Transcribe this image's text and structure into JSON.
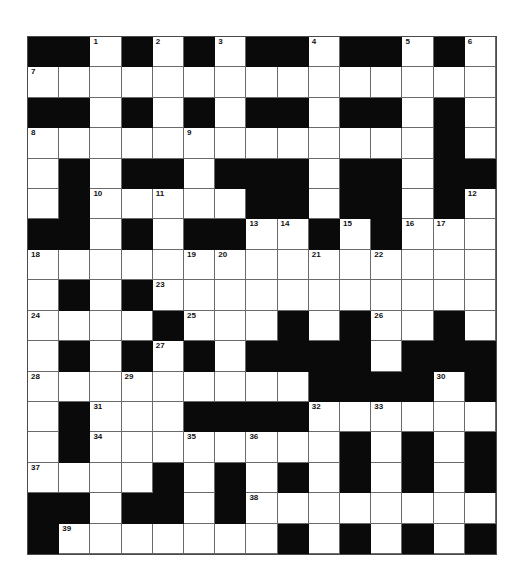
{
  "puzzle": {
    "rows": 17,
    "cols": 15,
    "colors": {
      "block": "#0a0a0a",
      "cell": "#ffffff",
      "grid_line": "#6a6a6a"
    },
    "grid": [
      [
        "#",
        "#",
        "1",
        "#",
        "2",
        "#",
        "3",
        "#",
        "#",
        "4",
        "#",
        "#",
        "5",
        "#",
        "6"
      ],
      [
        "7",
        "",
        "",
        "",
        "",
        "",
        "",
        "",
        "",
        "",
        "",
        "",
        "",
        "",
        ""
      ],
      [
        "#",
        "#",
        "",
        "#",
        "",
        "#",
        "",
        "#",
        "#",
        "",
        "#",
        "#",
        "",
        "#",
        ""
      ],
      [
        "8",
        "",
        "",
        "",
        "",
        "9",
        "",
        "",
        "",
        "",
        "",
        "",
        "",
        "#",
        ""
      ],
      [
        "",
        "#",
        "",
        "#",
        "#",
        "",
        "#",
        "#",
        "#",
        "",
        "#",
        "#",
        "",
        "#",
        "#"
      ],
      [
        "",
        "#",
        "10",
        "",
        "11",
        "",
        "",
        "#",
        "#",
        "",
        "#",
        "#",
        "",
        "#",
        "12"
      ],
      [
        "#",
        "#",
        "",
        "#",
        "",
        "#",
        "#",
        "13",
        "14",
        "#",
        "15",
        "#",
        "16",
        "17",
        ""
      ],
      [
        "18",
        "",
        "",
        "",
        "",
        "19",
        "20",
        "",
        "",
        "21",
        "",
        "22",
        "",
        "",
        ""
      ],
      [
        "",
        "#",
        "",
        "#",
        "23",
        "",
        "",
        "",
        "",
        "",
        "",
        "",
        "",
        "",
        ""
      ],
      [
        "24",
        "",
        "",
        "",
        "#",
        "25",
        "",
        "",
        "#",
        "",
        "#",
        "26",
        "",
        "#",
        ""
      ],
      [
        "",
        "#",
        "",
        "#",
        "27",
        "#",
        "",
        "#",
        "#",
        "#",
        "#",
        "",
        "#",
        "#",
        "#"
      ],
      [
        "28",
        "",
        "",
        "29",
        "",
        "",
        "",
        "",
        "",
        "#",
        "#",
        "#",
        "#",
        "30",
        "#"
      ],
      [
        "",
        "#",
        "31",
        "",
        "",
        "#",
        "#",
        "#",
        "#",
        "32",
        "",
        "33",
        "",
        "",
        ""
      ],
      [
        "",
        "#",
        "34",
        "",
        "",
        "35",
        "",
        "36",
        "",
        "",
        "#",
        "",
        "#",
        "",
        "#"
      ],
      [
        "37",
        "",
        "",
        "",
        "#",
        "",
        "#",
        "",
        "#",
        "",
        "#",
        "",
        "#",
        "",
        "#"
      ],
      [
        "#",
        "#",
        "",
        "#",
        "#",
        "",
        "#",
        "38",
        "",
        "",
        "",
        "",
        "",
        "",
        ""
      ],
      [
        "#",
        "39",
        "",
        "",
        "",
        "",
        "",
        "",
        "#",
        "",
        "#",
        "",
        "#",
        "",
        "#"
      ]
    ],
    "clue_numbers": [
      1,
      2,
      3,
      4,
      5,
      6,
      7,
      8,
      9,
      10,
      11,
      12,
      13,
      14,
      15,
      16,
      17,
      18,
      19,
      20,
      21,
      22,
      23,
      24,
      25,
      26,
      27,
      28,
      29,
      30,
      31,
      32,
      33,
      34,
      35,
      36,
      37,
      38,
      39
    ]
  }
}
